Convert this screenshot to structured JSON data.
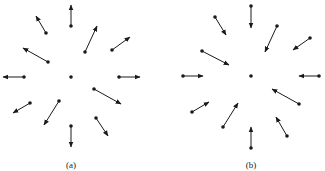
{
  "figure": {
    "panels": [
      {
        "label": "(a)",
        "direction": "outward",
        "center": [
          71,
          77
        ],
        "vectors": [
          {
            "from": [
              71,
              26
            ],
            "to": [
              71,
              5
            ]
          },
          {
            "from": [
              46,
              33
            ],
            "to": [
              36,
              16
            ]
          },
          {
            "from": [
              85,
              52
            ],
            "to": [
              97,
              26
            ]
          },
          {
            "from": [
              112,
              50
            ],
            "to": [
              130,
              37
            ]
          },
          {
            "from": [
              48,
              62
            ],
            "to": [
              23,
              48
            ]
          },
          {
            "from": [
              24,
              77
            ],
            "to": [
              3,
              77
            ]
          },
          {
            "from": [
              119,
              77
            ],
            "to": [
              140,
              77
            ]
          },
          {
            "from": [
              94,
              89
            ],
            "to": [
              121,
              104
            ]
          },
          {
            "from": [
              30,
              103
            ],
            "to": [
              13,
              113
            ]
          },
          {
            "from": [
              59,
              101
            ],
            "to": [
              44,
              125
            ]
          },
          {
            "from": [
              96,
              118
            ],
            "to": [
              108,
              136
            ]
          },
          {
            "from": [
              71,
              126
            ],
            "to": [
              71,
              147
            ]
          }
        ]
      },
      {
        "label": "(b)",
        "direction": "inward",
        "center": [
          251,
          76
        ],
        "vectors": [
          {
            "from": [
              251,
              6
            ],
            "to": [
              251,
              28
            ]
          },
          {
            "from": [
              215,
              17
            ],
            "to": [
              226,
              35
            ]
          },
          {
            "from": [
              277,
              26
            ],
            "to": [
              265,
              52
            ]
          },
          {
            "from": [
              310,
              38
            ],
            "to": [
              293,
              50
            ]
          },
          {
            "from": [
              202,
              51
            ],
            "to": [
              229,
              65
            ]
          },
          {
            "from": [
              183,
              76
            ],
            "to": [
              203,
              76
            ]
          },
          {
            "from": [
              319,
              76
            ],
            "to": [
              299,
              76
            ]
          },
          {
            "from": [
              299,
              104
            ],
            "to": [
              272,
              89
            ]
          },
          {
            "from": [
              192,
              112
            ],
            "to": [
              209,
              102
            ]
          },
          {
            "from": [
              223,
              127
            ],
            "to": [
              238,
              103
            ]
          },
          {
            "from": [
              287,
              136
            ],
            "to": [
              276,
              117
            ]
          },
          {
            "from": [
              251,
              148
            ],
            "to": [
              251,
              127
            ]
          }
        ]
      }
    ],
    "colors": {
      "ink": "#1a1a1a",
      "background": "#ffffff"
    }
  }
}
